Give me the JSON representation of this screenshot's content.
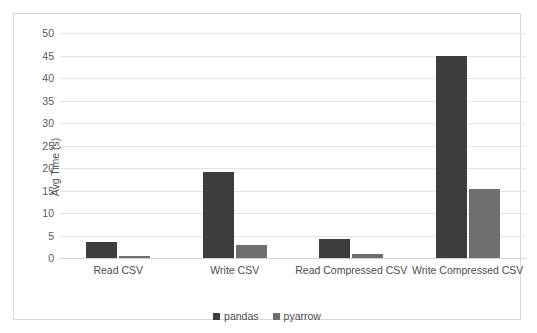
{
  "chart_data": {
    "type": "bar",
    "title": "",
    "xlabel": "",
    "ylabel": "Avg Time (s)",
    "ylim": [
      0,
      50
    ],
    "ytick_step": 5,
    "yticks": [
      50,
      45,
      40,
      35,
      30,
      25,
      20,
      15,
      10,
      5,
      0
    ],
    "grid": true,
    "legend_position": "bottom",
    "categories": [
      "Read CSV",
      "Write CSV",
      "Read Compressed CSV",
      "Write Compressed CSV"
    ],
    "series": [
      {
        "name": "pandas",
        "color": "#3d3d3d",
        "values": [
          3.5,
          19.2,
          4.3,
          44.8
        ]
      },
      {
        "name": "pyarrow",
        "color": "#6e6e6e",
        "values": [
          0.4,
          3.0,
          1.0,
          15.4
        ]
      }
    ]
  },
  "legend": {
    "items": [
      {
        "label": "pandas"
      },
      {
        "label": "pyarrow"
      }
    ]
  },
  "colors": {
    "pandas": "#3d3d3d",
    "pyarrow": "#6e6e6e",
    "gridline": "#e4e4e4",
    "frame": "#d8d8d8",
    "text": "#4d4d4d"
  }
}
